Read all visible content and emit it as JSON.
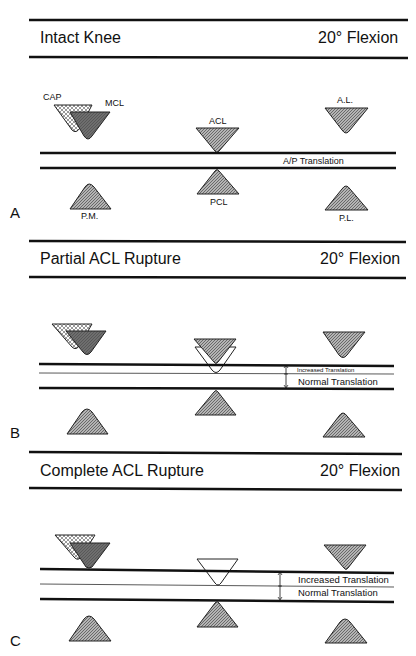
{
  "panels": [
    {
      "letter": "A",
      "title": "Intact Knee",
      "angle": "20° Flexion",
      "translation_label": "A/P Translation"
    },
    {
      "letter": "B",
      "title": "Partial ACL Rupture",
      "angle": "20° Flexion",
      "increased_label": "Increased Translation",
      "normal_label": "Normal Translation"
    },
    {
      "letter": "C",
      "title": "Complete ACL Rupture",
      "angle": "20° Flexion",
      "increased_label": "Increased Translation",
      "normal_label": "Normal Translation"
    }
  ],
  "ligament_labels": {
    "cap": "CAP",
    "mcl": "MCL",
    "acl": "ACL",
    "al": "A.L.",
    "pm": "P.M.",
    "pcl": "PCL",
    "pl": "P.L."
  },
  "colors": {
    "line": "#111111",
    "hatch_fill": "#9a9a9a",
    "mcl_fill": "#6a6a6a",
    "cap_fill": "#d8d8d8"
  }
}
